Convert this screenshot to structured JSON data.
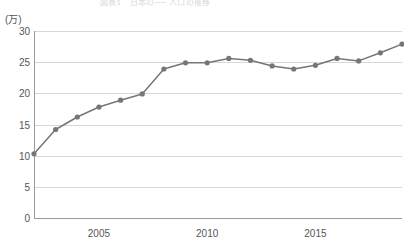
{
  "title": {
    "text": "図表1　日本の── 人口の推移",
    "visible_partial": true
  },
  "axes": {
    "y_unit": "(万)",
    "y_ticks": [
      "30",
      "25",
      "20",
      "15",
      "10",
      "5",
      "0"
    ],
    "y_tick_values": [
      30,
      25,
      20,
      15,
      10,
      5,
      0
    ],
    "x_ticks": [
      "2005",
      "2010",
      "2015"
    ],
    "x_tick_values": [
      2005,
      2010,
      2015
    ]
  },
  "colors": {
    "line": "#767676",
    "marker": "#767676",
    "grid": "#d6d6d6",
    "axis": "#9a9a9a",
    "text": "#555555",
    "background": "#ffffff"
  },
  "chart_data": {
    "type": "line",
    "title": "図表1　日本の── 人口の推移",
    "xlabel": "",
    "ylabel": "(万)",
    "ylim": [
      0,
      30
    ],
    "xlim": [
      2002,
      2019
    ],
    "grid": true,
    "legend": "none",
    "x": [
      2002,
      2003,
      2004,
      2005,
      2006,
      2007,
      2008,
      2009,
      2010,
      2011,
      2012,
      2013,
      2014,
      2015,
      2016,
      2017,
      2018,
      2019
    ],
    "categories": [
      "2002",
      "2003",
      "2004",
      "2005",
      "2006",
      "2007",
      "2008",
      "2009",
      "2010",
      "2011",
      "2012",
      "2013",
      "2014",
      "2015",
      "2016",
      "2017",
      "2018",
      "2019"
    ],
    "values": [
      10.3,
      14.2,
      16.2,
      17.8,
      18.9,
      19.9,
      23.9,
      24.9,
      24.9,
      25.6,
      25.3,
      24.4,
      23.9,
      24.5,
      25.6,
      25.2,
      26.5,
      27.9
    ],
    "series": [
      {
        "name": "人口",
        "values": [
          10.3,
          14.2,
          16.2,
          17.8,
          18.9,
          19.9,
          23.9,
          24.9,
          24.9,
          25.6,
          25.3,
          24.4,
          23.9,
          24.5,
          25.6,
          25.2,
          26.5,
          27.9
        ]
      }
    ]
  }
}
